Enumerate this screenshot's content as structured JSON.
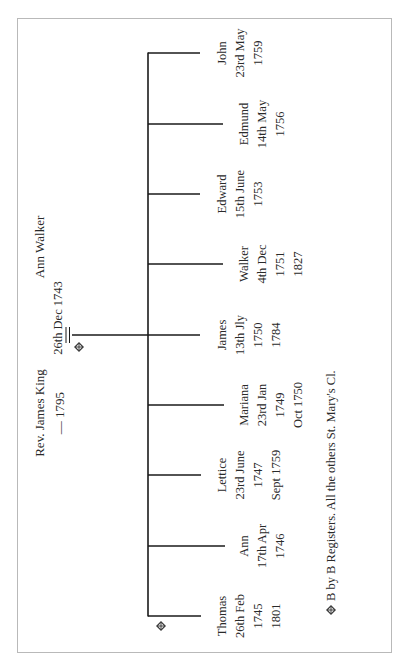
{
  "diagram": {
    "type": "family-tree",
    "orientation": "rotated-90-ccw",
    "colors": {
      "line": "#1a1a1a",
      "text": "#2a2a2a",
      "frame": "#b9b9b9",
      "background": "#ffffff"
    },
    "parents": {
      "father": {
        "name": "Rev. James King",
        "dates": "— 1795"
      },
      "mother": {
        "name": "Ann Walker"
      },
      "marriage": {
        "date": "26th Dec 1743",
        "symbol": "=",
        "marker": "diamond-cross-icon"
      }
    },
    "children": [
      {
        "name": "Thomas",
        "lines": [
          "Thomas",
          "26th Feb",
          "1745",
          "1801"
        ],
        "marker": "diamond-cross-icon"
      },
      {
        "name": "Ann",
        "lines": [
          "Ann",
          "17th Apr",
          "1746"
        ]
      },
      {
        "name": "Lettice",
        "lines": [
          "Lettice",
          "23rd June",
          "1747",
          "Sept 1759"
        ]
      },
      {
        "name": "Mariana",
        "lines": [
          "Mariana",
          "23rd Jan",
          "1749",
          "Oct 1750"
        ]
      },
      {
        "name": "James",
        "lines": [
          "James",
          "13th Jly",
          "1750",
          "1784"
        ]
      },
      {
        "name": "Walker",
        "lines": [
          "Walker",
          "4th Dec",
          "1751",
          "1827"
        ]
      },
      {
        "name": "Edward",
        "lines": [
          "Edward",
          "15th June",
          "1753"
        ]
      },
      {
        "name": "Edmund",
        "lines": [
          "Edmund",
          "14th May",
          "1756"
        ]
      },
      {
        "name": "John",
        "lines": [
          "John",
          "23rd May",
          "1759"
        ]
      }
    ],
    "footnote": {
      "marker": "diamond-cross-icon",
      "text": "B by B Registers. All the others St. Mary's Cl."
    }
  }
}
